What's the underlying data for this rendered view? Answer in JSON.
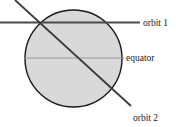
{
  "figure": {
    "background_color": "#ffffff"
  },
  "chart_data": {
    "type": "diagram",
    "title": "",
    "subtitle": "",
    "xlabel": "",
    "ylabel": "",
    "grid": false,
    "legend_position": "inline-right-labels",
    "canvas": {
      "width": 176,
      "height": 127
    },
    "shapes": [
      {
        "name": "planet",
        "kind": "circle",
        "cx": 73.5,
        "cy": 58.5,
        "r": 48.5,
        "fill": "#d9d9d9",
        "stroke": "#1a1a1a",
        "stroke_width": 1.4
      },
      {
        "name": "orbit-1",
        "kind": "line",
        "x1": 0,
        "y1": 22.5,
        "x2": 140,
        "y2": 22.5,
        "stroke": "#4a4a4a",
        "stroke_width": 1.8,
        "label": "orbit 1"
      },
      {
        "name": "orbit-2",
        "kind": "line",
        "x1": 15,
        "y1": 0,
        "x2": 131,
        "y2": 106,
        "stroke": "#3a3a3a",
        "stroke_width": 1.8,
        "label": "orbit 2"
      },
      {
        "name": "equator",
        "kind": "line",
        "x1": 25,
        "y1": 58,
        "x2": 124,
        "y2": 58,
        "stroke": "#9a9a9a",
        "stroke_width": 1.0,
        "label": "equator"
      }
    ],
    "labels": [
      {
        "name": "orbit-1-label",
        "text": "orbit 1",
        "x": 143,
        "y": 26
      },
      {
        "name": "equator-label",
        "text": "equator",
        "x": 126,
        "y": 61
      },
      {
        "name": "orbit-2-label",
        "text": "orbit 2",
        "x": 133,
        "y": 121
      }
    ],
    "colors": {
      "planet_fill": "#d9d9d9",
      "planet_outline": "#1a1a1a",
      "orbit_line": "#3f3f3f",
      "equator_line": "#9a9a9a",
      "text": "#1a1a1a"
    }
  }
}
